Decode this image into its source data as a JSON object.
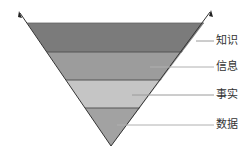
{
  "diagram": {
    "type": "inverted-pyramid",
    "layers": [
      {
        "label": "知识",
        "color": "#7b7b7b"
      },
      {
        "label": "信息",
        "color": "#9c9c9c"
      },
      {
        "label": "事实",
        "color": "#c5c5c5"
      },
      {
        "label": "数据",
        "color": "#a2a2a2"
      }
    ],
    "line_color": "#555555",
    "leader_color": "#9a9a9a"
  }
}
